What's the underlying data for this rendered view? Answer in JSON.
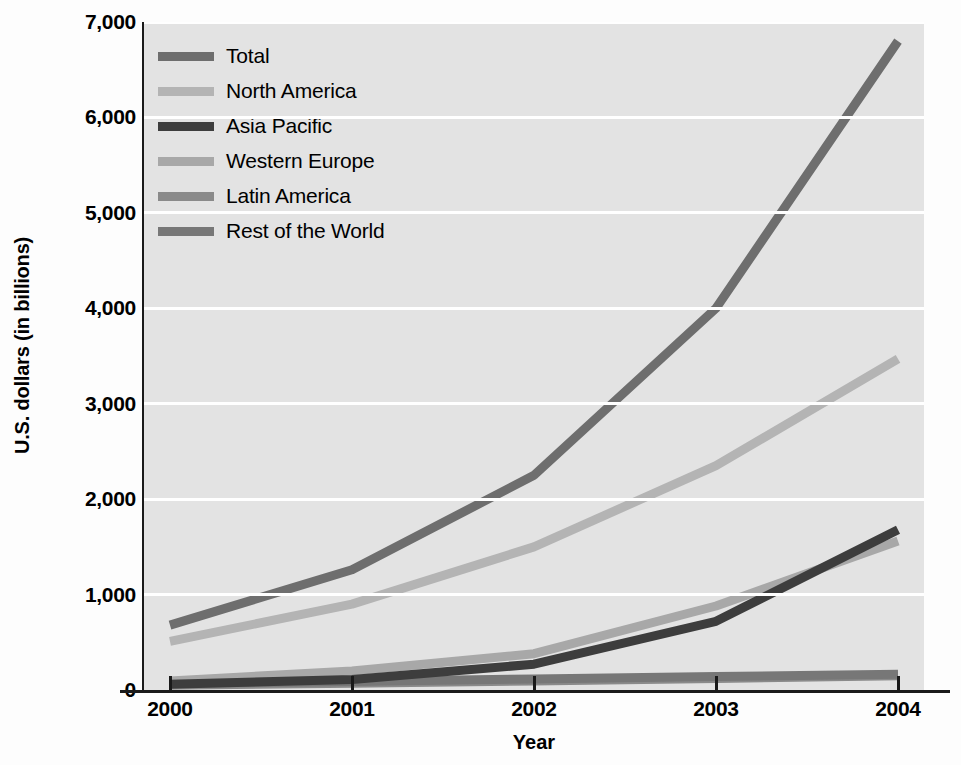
{
  "chart_data": {
    "type": "line",
    "title": "",
    "xlabel": "Year",
    "ylabel": "U.S. dollars (in billions)",
    "categories": [
      "2000",
      "2001",
      "2002",
      "2003",
      "2004"
    ],
    "x": [
      2000,
      2001,
      2002,
      2003,
      2004
    ],
    "xlim": [
      2000,
      2004
    ],
    "ylim": [
      0,
      7000
    ],
    "yticks": [
      0,
      1000,
      2000,
      3000,
      4000,
      5000,
      6000,
      7000
    ],
    "ytick_labels": [
      "0",
      "1,000",
      "2,000",
      "3,000",
      "4,000",
      "5,000",
      "6,000",
      "7,000"
    ],
    "grid": "horizontal",
    "legend_position": "inside top-left",
    "plot_background": "#e3e3e3",
    "gridline_color": "#ffffff",
    "axis_color": "#1a1a1a",
    "series": [
      {
        "name": "Total",
        "color": "#6e6e6e",
        "values": [
          680,
          1260,
          2250,
          4000,
          6800
        ]
      },
      {
        "name": "North America",
        "color": "#b4b4b4",
        "values": [
          510,
          900,
          1500,
          2350,
          3470
        ]
      },
      {
        "name": "Asia Pacific",
        "color": "#3d3d3d",
        "values": [
          60,
          110,
          270,
          720,
          1680
        ]
      },
      {
        "name": "Western Europe",
        "color": "#a8a8a8",
        "values": [
          95,
          200,
          380,
          880,
          1560
        ]
      },
      {
        "name": "Latin America",
        "color": "#8a8a8a",
        "values": [
          50,
          70,
          95,
          120,
          150
        ]
      },
      {
        "name": "Rest of the World",
        "color": "#777777",
        "values": [
          70,
          90,
          115,
          140,
          165
        ]
      }
    ]
  }
}
